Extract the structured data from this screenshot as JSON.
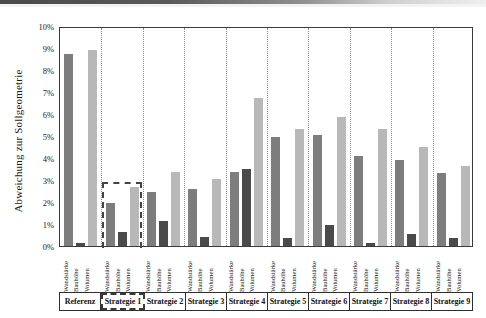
{
  "axis": {
    "y_title": "Abweichung zur Sollgeometrie",
    "y_ticks": [
      "0%",
      "1%",
      "2%",
      "3%",
      "4%",
      "5%",
      "6%",
      "7%",
      "8%",
      "9%",
      "10%"
    ]
  },
  "series_names": [
    "Wandstärke",
    "Bauhöhe",
    "Volumen"
  ],
  "groups": [
    "Referenz",
    "Strategie 1",
    "Strategie 2",
    "Strategie 3",
    "Strategie 4",
    "Strategie 5",
    "Strategie 6",
    "Strategie 7",
    "Strategie 8",
    "Strategie 9"
  ],
  "highlighted_group": "Strategie 1",
  "colors": {
    "wandstaerke": "#7d7d7d",
    "bauhoehe": "#4a4a4a",
    "volumen": "#b8b8b8",
    "frame": "#3a3a3a",
    "gridline": "#8a8a8a"
  },
  "chart_data": {
    "type": "bar",
    "title": "",
    "xlabel": "",
    "ylabel": "Abweichung zur Sollgeometrie",
    "ylim": [
      0,
      10
    ],
    "yunit": "%",
    "ytick_step": 1,
    "grid": false,
    "legend": "none",
    "categories": [
      "Referenz",
      "Strategie 1",
      "Strategie 2",
      "Strategie 3",
      "Strategie 4",
      "Strategie 5",
      "Strategie 6",
      "Strategie 7",
      "Strategie 8",
      "Strategie 9"
    ],
    "series": [
      {
        "name": "Wandstärke",
        "values": [
          8.75,
          1.95,
          2.45,
          2.6,
          3.35,
          4.95,
          5.05,
          4.1,
          3.9,
          3.3
        ]
      },
      {
        "name": "Bauhöhe",
        "values": [
          0.15,
          0.65,
          1.15,
          0.4,
          3.5,
          0.35,
          0.95,
          0.15,
          0.55,
          0.35
        ]
      },
      {
        "name": "Volumen",
        "values": [
          8.9,
          2.7,
          3.35,
          3.05,
          6.75,
          5.3,
          5.85,
          5.3,
          4.5,
          3.65
        ]
      }
    ],
    "annotations": [
      {
        "type": "dashed-box",
        "target": "Strategie 1",
        "top_value": 3.0
      }
    ]
  }
}
